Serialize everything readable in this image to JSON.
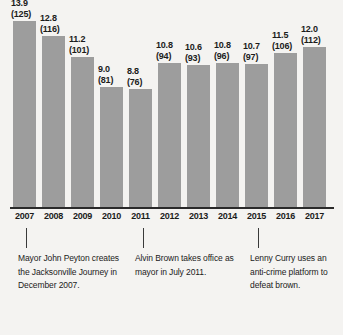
{
  "chart_data": {
    "type": "bar",
    "title": "",
    "subtitle": "",
    "xlabel": "",
    "ylabel": "",
    "ylim": [
      0,
      14.6
    ],
    "grid": false,
    "legend": "none",
    "categories": [
      "2007",
      "2008",
      "2009",
      "2010",
      "2011",
      "2012",
      "2013",
      "2014",
      "2015",
      "2016",
      "2017"
    ],
    "values": [
      13.9,
      12.8,
      11.2,
      9.0,
      8.8,
      10.8,
      10.6,
      10.8,
      10.7,
      11.5,
      12.0
    ],
    "counts": [
      125,
      116,
      101,
      81,
      76,
      94,
      93,
      96,
      97,
      106,
      112
    ],
    "bars": [
      {
        "category": "2007",
        "value": "13.9",
        "count": "(125)",
        "value_num": 13.9
      },
      {
        "category": "2008",
        "value": "12.8",
        "count": "(116)",
        "value_num": 12.8
      },
      {
        "category": "2009",
        "value": "11.2",
        "count": "(101)",
        "value_num": 11.2
      },
      {
        "category": "2010",
        "value": "9.0",
        "count": "(81)",
        "value_num": 9.0
      },
      {
        "category": "2011",
        "value": "8.8",
        "count": "(76)",
        "value_num": 8.8
      },
      {
        "category": "2012",
        "value": "10.8",
        "count": "(94)",
        "value_num": 10.8
      },
      {
        "category": "2013",
        "value": "10.6",
        "count": "(93)",
        "value_num": 10.6
      },
      {
        "category": "2014",
        "value": "10.8",
        "count": "(96)",
        "value_num": 10.8
      },
      {
        "category": "2015",
        "value": "10.7",
        "count": "(97)",
        "value_num": 10.7
      },
      {
        "category": "2016",
        "value": "11.5",
        "count": "(106)",
        "value_num": 11.5
      },
      {
        "category": "2017",
        "value": "12.0",
        "count": "(112)",
        "value_num": 12.0
      }
    ],
    "annotations": [
      {
        "anchor_category": "2007",
        "text": "Mayor John Peyton creates the Jacksonville Journey in December 2007."
      },
      {
        "anchor_category": "2011",
        "text": "Alvin Brown takes office as mayor in July 2011."
      },
      {
        "anchor_category": "2015",
        "text": "Lenny Curry uses an anti-crime platform to defeat brown."
      }
    ]
  },
  "colors": {
    "bar": "#9d9d9d",
    "background": "#f4f3f1",
    "text": "#1b1b1b",
    "axis": "#2a2a2a"
  }
}
